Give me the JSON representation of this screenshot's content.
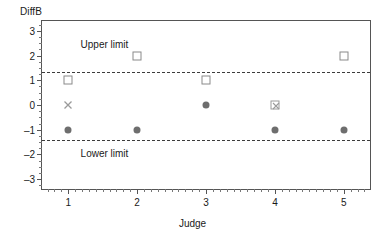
{
  "chart_data": {
    "type": "scatter",
    "title": "",
    "xlabel": "Judge",
    "ylabel": "DiffB",
    "xlim": [
      0.62,
      5.38
    ],
    "ylim": [
      -3.4,
      3.4
    ],
    "grid": false,
    "legend": false,
    "x_ticks": [
      1,
      2,
      3,
      4,
      5
    ],
    "x_tick_labels": [
      "1",
      "2",
      "3",
      "4",
      "5"
    ],
    "y_ticks": [
      3,
      2,
      1,
      0,
      -1,
      -2,
      -3
    ],
    "y_tick_labels": [
      "3",
      "2",
      "1",
      "0",
      "–1",
      "–2",
      "–3"
    ],
    "y_minor_tick_step": 0.25,
    "x_minor_tick_step": 0.1,
    "categories": [
      "1",
      "2",
      "3",
      "4",
      "5"
    ],
    "annotations": [
      {
        "text": "Upper limit",
        "x": 1.18,
        "y": 2.45
      },
      {
        "text": "Lower limit",
        "x": 1.18,
        "y": -1.95
      }
    ],
    "reference_lines": [
      {
        "name": "Upper limit",
        "y": 1.35,
        "style": "dashed",
        "color": "#3c3c3c"
      },
      {
        "name": "Lower limit",
        "y": -1.42,
        "style": "dashed",
        "color": "#3c3c3c"
      }
    ],
    "series": [
      {
        "name": "open-square",
        "marker": "square-open",
        "color": "#8a8a8a",
        "points": [
          {
            "x": 1,
            "y": 1
          },
          {
            "x": 2,
            "y": 2
          },
          {
            "x": 3,
            "y": 1
          },
          {
            "x": 5,
            "y": 2
          }
        ]
      },
      {
        "name": "filled-circle",
        "marker": "circle-filled",
        "color": "#6e6e6e",
        "points": [
          {
            "x": 1,
            "y": -1
          },
          {
            "x": 2,
            "y": -1
          },
          {
            "x": 3,
            "y": 0
          },
          {
            "x": 4,
            "y": -1
          },
          {
            "x": 5,
            "y": -1
          }
        ]
      },
      {
        "name": "cross",
        "marker": "cross",
        "color": "#9a9a9a",
        "points": [
          {
            "x": 1,
            "y": 0
          }
        ]
      },
      {
        "name": "square-with-cross",
        "marker": "square-cross",
        "color": "#9a9a9a",
        "points": [
          {
            "x": 4,
            "y": 0
          }
        ]
      }
    ]
  }
}
